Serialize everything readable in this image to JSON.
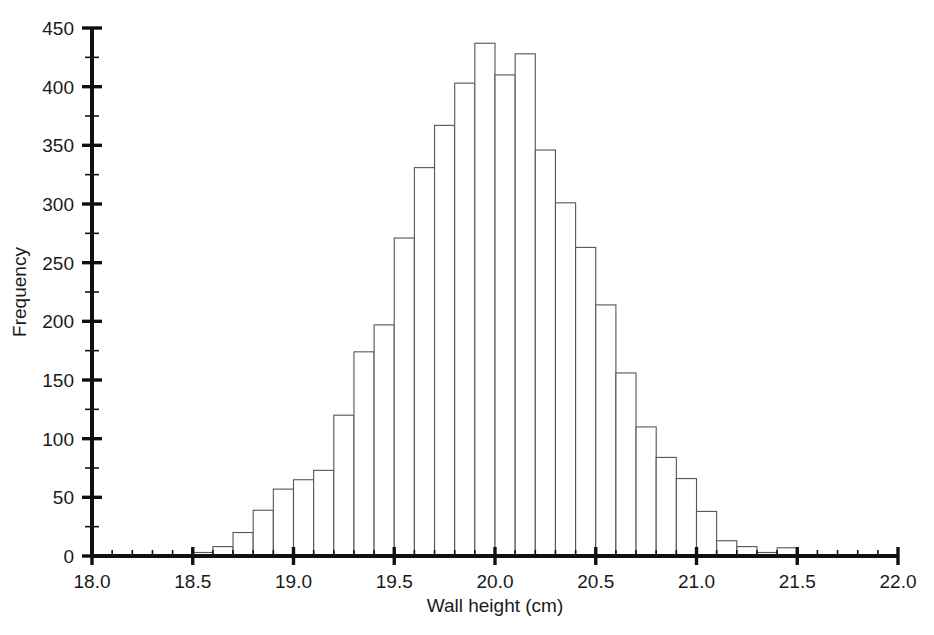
{
  "chart_data": {
    "type": "bar",
    "title": "",
    "subtitle": "",
    "xlabel": "Wall height (cm)",
    "ylabel": "Frequency",
    "xlim": [
      18.0,
      22.0
    ],
    "ylim": [
      0,
      450
    ],
    "grid": false,
    "legend": null,
    "bin_width": 0.1,
    "x_major_tick_step": 0.5,
    "x_minor_tick_step": 0.1,
    "y_major_tick_step": 50,
    "y_minor_tick_step": 25,
    "xticklabels": [
      "18.0",
      "18.5",
      "19.0",
      "19.5",
      "20.0",
      "20.5",
      "21.0",
      "21.5",
      "22.0"
    ],
    "xtickvalues": [
      18.0,
      18.5,
      19.0,
      19.5,
      20.0,
      20.5,
      21.0,
      21.5,
      22.0
    ],
    "yticklabels": [
      "0",
      "50",
      "100",
      "150",
      "200",
      "250",
      "300",
      "350",
      "400",
      "450"
    ],
    "ytickvalues": [
      0,
      50,
      100,
      150,
      200,
      250,
      300,
      350,
      400,
      450
    ],
    "bin_starts": [
      18.5,
      18.6,
      18.7,
      18.8,
      18.9,
      19.0,
      19.1,
      19.2,
      19.3,
      19.4,
      19.5,
      19.6,
      19.7,
      19.8,
      19.9,
      20.0,
      20.1,
      20.2,
      20.3,
      20.4,
      20.5,
      20.6,
      20.7,
      20.8,
      20.9,
      21.0,
      21.1,
      21.2,
      21.3,
      21.4
    ],
    "categories": [
      "18.5-18.6",
      "18.6-18.7",
      "18.7-18.8",
      "18.8-18.9",
      "18.9-19.0",
      "19.0-19.1",
      "19.1-19.2",
      "19.2-19.3",
      "19.3-19.4",
      "19.4-19.5",
      "19.5-19.6",
      "19.6-19.7",
      "19.7-19.8",
      "19.8-19.9",
      "19.9-20.0",
      "20.0-20.1",
      "20.1-20.2",
      "20.2-20.3",
      "20.3-20.4",
      "20.4-20.5",
      "20.5-20.6",
      "20.6-20.7",
      "20.7-20.8",
      "20.8-20.9",
      "20.9-21.0",
      "21.0-21.1",
      "21.1-21.2",
      "21.2-21.3",
      "21.3-21.4",
      "21.4-21.5"
    ],
    "values": [
      3,
      8,
      20,
      39,
      57,
      65,
      73,
      120,
      174,
      197,
      271,
      331,
      367,
      403,
      437,
      410,
      428,
      346,
      301,
      263,
      214,
      156,
      110,
      84,
      66,
      38,
      13,
      8,
      3,
      7
    ]
  },
  "axis": {
    "x_title": "Wall height (cm)",
    "y_title": "Frequency"
  },
  "colors": {
    "bar_fill": "#ffffff",
    "bar_stroke": "#555555",
    "axis": "#111111",
    "text": "#1a1a1a",
    "background": "#ffffff"
  }
}
